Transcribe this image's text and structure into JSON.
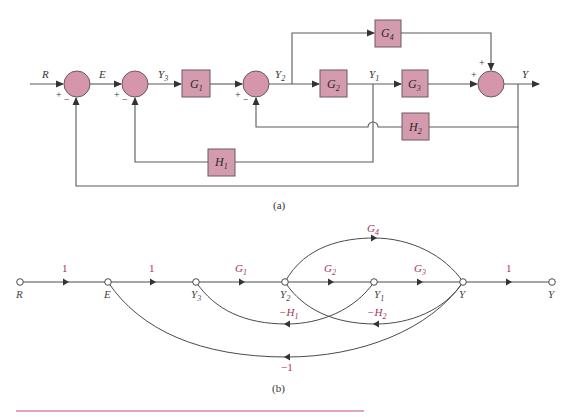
{
  "block_diagram": {
    "caption": "(a)",
    "signals": {
      "R": "R",
      "E": "E",
      "Y3": {
        "base": "Y",
        "sub": "3"
      },
      "Y2": {
        "base": "Y",
        "sub": "2"
      },
      "Y1": {
        "base": "Y",
        "sub": "1"
      },
      "Y": "Y"
    },
    "blocks": [
      {
        "id": "G1",
        "base": "G",
        "sub": "1"
      },
      {
        "id": "G2",
        "base": "G",
        "sub": "2"
      },
      {
        "id": "G3",
        "base": "G",
        "sub": "3"
      },
      {
        "id": "G4",
        "base": "G",
        "sub": "4"
      },
      {
        "id": "H1",
        "base": "H",
        "sub": "1"
      },
      {
        "id": "H2",
        "base": "H",
        "sub": "2"
      }
    ],
    "junctions": [
      {
        "id": "sum1",
        "signs": {
          "input": "+",
          "feedback": "−"
        }
      },
      {
        "id": "sum2",
        "signs": {
          "input": "+",
          "feedback": "−"
        }
      },
      {
        "id": "sum3",
        "signs": {
          "input": "+",
          "feedback": "−"
        }
      },
      {
        "id": "sum4",
        "signs": {
          "input": "+",
          "top": "+"
        }
      }
    ],
    "colors": {
      "block_fill": "#d49aae",
      "junction_fill": "#d596ab",
      "wire": "#5a5a5a"
    }
  },
  "signal_flow_graph": {
    "caption": "(b)",
    "nodes": [
      {
        "id": "R",
        "base": "R",
        "sub": ""
      },
      {
        "id": "E",
        "base": "E",
        "sub": ""
      },
      {
        "id": "Y3",
        "base": "Y",
        "sub": "3"
      },
      {
        "id": "Y2",
        "base": "Y",
        "sub": "2"
      },
      {
        "id": "Y1",
        "base": "Y",
        "sub": "1"
      },
      {
        "id": "Y",
        "base": "Y",
        "sub": ""
      },
      {
        "id": "Yout",
        "base": "Y",
        "sub": ""
      }
    ],
    "edges": [
      {
        "from": "R",
        "to": "E",
        "gain": "1"
      },
      {
        "from": "E",
        "to": "Y3",
        "gain": "1"
      },
      {
        "from": "Y3",
        "to": "Y2",
        "gain_base": "G",
        "gain_sub": "1"
      },
      {
        "from": "Y2",
        "to": "Y1",
        "gain_base": "G",
        "gain_sub": "2"
      },
      {
        "from": "Y1",
        "to": "Y",
        "gain_base": "G",
        "gain_sub": "3"
      },
      {
        "from": "Y2",
        "to": "Y",
        "gain_base": "G",
        "gain_sub": "4"
      },
      {
        "from": "Y",
        "to": "Yout",
        "gain": "1"
      },
      {
        "from": "Y1",
        "to": "Y3",
        "gain_base": "−H",
        "gain_sub": "1"
      },
      {
        "from": "Y",
        "to": "Y2",
        "gain_base": "−H",
        "gain_sub": "2"
      },
      {
        "from": "Y",
        "to": "E",
        "gain": "−1"
      }
    ],
    "colors": {
      "gain_label": "#a8325a",
      "edge": "#4a4a4a"
    }
  },
  "footer": {
    "rule_color": "#c0506e"
  }
}
